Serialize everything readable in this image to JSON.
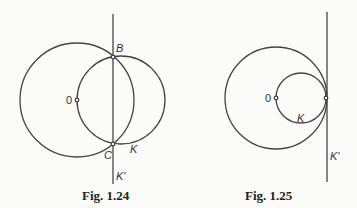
{
  "figures": [
    {
      "caption": "Fig. 1.24",
      "labels": {
        "center": "0",
        "top": "B",
        "bottom": "C",
        "circle": "K",
        "line": "K'"
      }
    },
    {
      "caption": "Fig. 1.25",
      "labels": {
        "center": "0",
        "circle": "K",
        "line": "K'"
      }
    }
  ],
  "colors": {
    "stroke": "#444444",
    "background": "#fbfbf9"
  }
}
